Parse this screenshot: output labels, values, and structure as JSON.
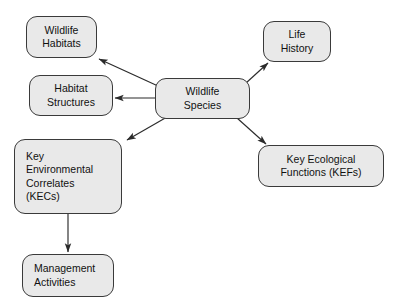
{
  "diagram": {
    "style": {
      "node_fill": "#e9e9e9",
      "node_border": "#3a3a3a",
      "edge_color": "#2b2b2b",
      "text_color": "#111111",
      "background": "#ffffff"
    },
    "nodes": [
      {
        "id": "wildlife-habitats",
        "lines": [
          "Wildlife",
          "Habitats"
        ],
        "align": "center",
        "x": 26,
        "y": 16,
        "w": 71,
        "h": 42
      },
      {
        "id": "habitat-structures",
        "lines": [
          "Habitat",
          "Structures"
        ],
        "align": "center",
        "x": 29,
        "y": 75,
        "w": 84,
        "h": 41
      },
      {
        "id": "wildlife-species",
        "lines": [
          "Wildlife",
          "Species"
        ],
        "align": "center",
        "x": 155,
        "y": 78,
        "w": 95,
        "h": 41
      },
      {
        "id": "life-history",
        "lines": [
          "Life",
          "History"
        ],
        "align": "center",
        "x": 263,
        "y": 21,
        "w": 68,
        "h": 41
      },
      {
        "id": "key-environmental-correlates",
        "lines": [
          "Key",
          "Environmental",
          "Correlates",
          "(KECs)"
        ],
        "align": "left",
        "x": 14,
        "y": 139,
        "w": 108,
        "h": 75
      },
      {
        "id": "key-ecological-functions",
        "lines": [
          "Key Ecological",
          "Functions (KEFs)"
        ],
        "align": "center",
        "x": 258,
        "y": 145,
        "w": 126,
        "h": 42
      },
      {
        "id": "management-activities",
        "lines": [
          "Management",
          "Activities"
        ],
        "align": "left",
        "x": 22,
        "y": 254,
        "w": 92,
        "h": 43
      }
    ],
    "edges": [
      {
        "id": "species-to-wildlife-habitats",
        "from": "wildlife-species",
        "to": "wildlife-habitats",
        "x1": 158,
        "y1": 86,
        "x2": 99,
        "y2": 59,
        "arrowhead": "to"
      },
      {
        "id": "species-to-habitat-structures",
        "from": "wildlife-species",
        "to": "habitat-structures",
        "x1": 155,
        "y1": 98,
        "x2": 115,
        "y2": 98,
        "arrowhead": "to"
      },
      {
        "id": "species-to-life-history",
        "from": "wildlife-species",
        "to": "life-history",
        "x1": 246,
        "y1": 83,
        "x2": 268,
        "y2": 63,
        "arrowhead": "to"
      },
      {
        "id": "species-to-key-environmental-correlates",
        "from": "wildlife-species",
        "to": "key-environmental-correlates",
        "x1": 167,
        "y1": 117,
        "x2": 127,
        "y2": 140,
        "arrowhead": "to"
      },
      {
        "id": "species-to-key-ecological-functions",
        "from": "wildlife-species",
        "to": "key-ecological-functions",
        "x1": 237,
        "y1": 118,
        "x2": 266,
        "y2": 144,
        "arrowhead": "to"
      },
      {
        "id": "correlates-to-management-activities",
        "from": "key-environmental-correlates",
        "to": "management-activities",
        "x1": 68,
        "y1": 214,
        "x2": 68,
        "y2": 252,
        "arrowhead": "to"
      }
    ]
  }
}
